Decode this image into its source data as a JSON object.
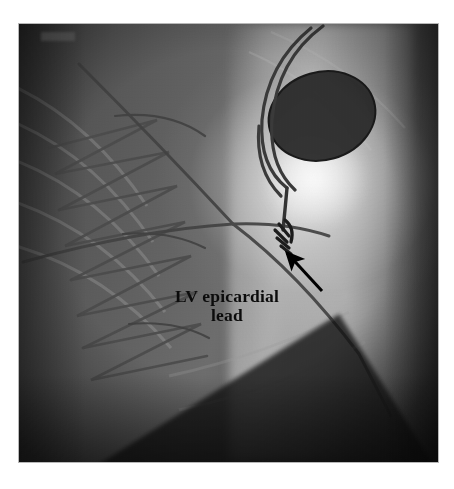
{
  "figure": {
    "kind": "fluoroscopy-radiograph",
    "modality": "fluoroscopy",
    "view": "chest - anteroposterior",
    "background_color": "#ffffff",
    "frame": {
      "x": 19,
      "y": 24,
      "width": 419,
      "height": 438
    }
  },
  "annotations": [
    {
      "id": "lv-epicardial-lead",
      "line_1": "LV epicardial",
      "line_2": "lead",
      "text_color": "#0b0b0b",
      "arrow": {
        "color": "#000000",
        "tail_x": 322,
        "tail_y": 291,
        "tip_x": 284,
        "tip_y": 251,
        "points_to": "electrode-tip"
      }
    }
  ],
  "features": [
    {
      "id": "pulse-generator",
      "label": "pacemaker pulse generator",
      "shape": "oval",
      "center_x": 322,
      "center_y": 116,
      "radius_x": 54,
      "radius_y": 44,
      "fill": "#2e2e2e"
    },
    {
      "id": "electrode-tip",
      "label": "radiopaque electrode tip",
      "center_x": 283,
      "center_y": 236,
      "fill": "#1d1d1d"
    },
    {
      "id": "sternal-wires",
      "label": "sternal cerclage wires",
      "stroke": "#4a4a4a"
    },
    {
      "id": "lead-body",
      "label": "pacing lead body",
      "stroke": "#3a3a3a"
    },
    {
      "id": "bright-lung-field",
      "label": "bright lung / mediastinal field",
      "fill": "#f2f2f2"
    },
    {
      "id": "collimation-shutter",
      "label": "collimation shutter edge",
      "fill": "#121212"
    }
  ]
}
